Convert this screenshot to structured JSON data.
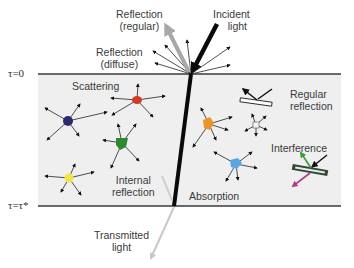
{
  "diagram": {
    "boundaries": {
      "top": "τ=0",
      "bottom": "τ=τ*"
    },
    "labels": {
      "reflection_regular": [
        "Reflection",
        "(regular)"
      ],
      "reflection_diffuse": [
        "Reflection",
        "(diffuse)"
      ],
      "incident_light": [
        "Incident",
        "light"
      ],
      "scattering": "Scattering",
      "regular_reflection": [
        "Regular",
        "reflection"
      ],
      "interference": "Interference",
      "internal_reflection": [
        "Internal",
        "reflection"
      ],
      "absorption": "Absorption",
      "transmitted_light": [
        "Transmitted",
        "light"
      ]
    },
    "particles": [
      {
        "name": "scatterer-navy",
        "color": "#2a2a6e"
      },
      {
        "name": "scatterer-red",
        "color": "#d03a20"
      },
      {
        "name": "scatterer-green",
        "color": "#2f8a2f"
      },
      {
        "name": "scatterer-yellow",
        "color": "#f2e44a"
      },
      {
        "name": "absorber-orange",
        "color": "#e8952a"
      },
      {
        "name": "absorber-white",
        "color": "#f4f4f4"
      },
      {
        "name": "absorber-blue",
        "color": "#5aa6e0"
      }
    ],
    "colors": {
      "slab_fill": "#efefef",
      "boundary_line": "#3a3a3a",
      "incident_beam": "#0a0a0a",
      "regular_reflection_beam": "#a8a8a8",
      "transmitted_beam": "#c8c8c8",
      "interference_up": "#3c9a3c",
      "interference_down": "#b23a8a",
      "film": "#2e4a36"
    }
  }
}
